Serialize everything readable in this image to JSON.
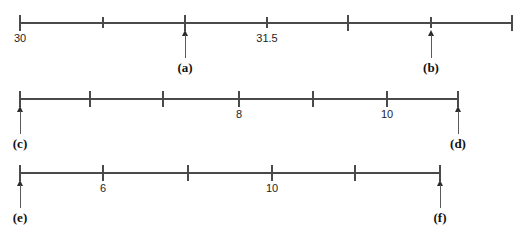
{
  "figure": {
    "title_clipped": "",
    "axis_color": "#4a4a4a",
    "pointer_color": "#2b2b2b",
    "label_color": "#1d1d1d",
    "number_lines": [
      {
        "id": "line-1",
        "axis": {
          "x_start": 20,
          "x_end": 512,
          "y": 22
        },
        "ticks": [
          {
            "x": 20,
            "height": 16,
            "label": "30"
          },
          {
            "x": 103,
            "height": 11,
            "label": ""
          },
          {
            "x": 185,
            "height": 16,
            "label": ""
          },
          {
            "x": 267,
            "height": 11,
            "label": "31.5"
          },
          {
            "x": 348,
            "height": 16,
            "label": ""
          },
          {
            "x": 431,
            "height": 11,
            "label": ""
          },
          {
            "x": 512,
            "height": 16,
            "label": ""
          }
        ],
        "pointers": [
          {
            "x": 185,
            "tag": "(a)"
          },
          {
            "x": 431,
            "tag": "(b)"
          }
        ]
      },
      {
        "id": "line-2",
        "axis": {
          "x_start": 20,
          "x_end": 458,
          "y": 98
        },
        "ticks": [
          {
            "x": 20,
            "height": 16,
            "label": ""
          },
          {
            "x": 90,
            "height": 16,
            "label": ""
          },
          {
            "x": 163,
            "height": 16,
            "label": ""
          },
          {
            "x": 239,
            "height": 16,
            "label": "8"
          },
          {
            "x": 313,
            "height": 16,
            "label": ""
          },
          {
            "x": 387,
            "height": 16,
            "label": "10"
          },
          {
            "x": 458,
            "height": 16,
            "label": ""
          }
        ],
        "pointers": [
          {
            "x": 20,
            "tag": "(c)"
          },
          {
            "x": 458,
            "tag": "(d)"
          }
        ]
      },
      {
        "id": "line-3",
        "axis": {
          "x_start": 20,
          "x_end": 440,
          "y": 172
        },
        "ticks": [
          {
            "x": 20,
            "height": 16,
            "label": ""
          },
          {
            "x": 103,
            "height": 16,
            "label": "6"
          },
          {
            "x": 188,
            "height": 16,
            "label": ""
          },
          {
            "x": 272,
            "height": 16,
            "label": "10"
          },
          {
            "x": 355,
            "height": 16,
            "label": ""
          },
          {
            "x": 440,
            "height": 16,
            "label": ""
          }
        ],
        "pointers": [
          {
            "x": 20,
            "tag": "(e)"
          },
          {
            "x": 440,
            "tag": "(f)"
          }
        ]
      }
    ]
  }
}
